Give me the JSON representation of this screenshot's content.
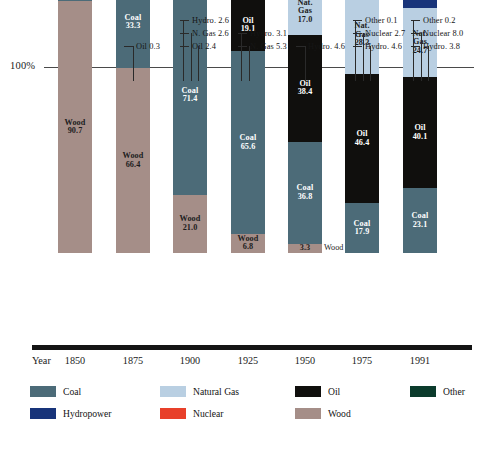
{
  "chart_data": {
    "type": "bar",
    "subtype": "stacked-100-percent",
    "title": "",
    "xlabel": "Year",
    "ylabel": "",
    "ylim": [
      0,
      100
    ],
    "axis_tick_labels": [
      "100%"
    ],
    "grid": false,
    "legend_position": "bottom",
    "categories": [
      "1850",
      "1875",
      "1900",
      "1925",
      "1950",
      "1975",
      "1991"
    ],
    "series": [
      {
        "name": "Wood",
        "color": "#a58e88",
        "values": [
          90.7,
          66.4,
          21.0,
          6.8,
          3.3,
          0.0,
          0.0
        ]
      },
      {
        "name": "Coal",
        "color": "#4c6b78",
        "values": [
          9.3,
          33.3,
          71.4,
          65.6,
          36.8,
          17.9,
          23.1
        ]
      },
      {
        "name": "Oil",
        "color": "#100f0d",
        "values": [
          0.0,
          0.3,
          2.4,
          19.1,
          38.4,
          46.4,
          40.1
        ]
      },
      {
        "name": "Natural Gas",
        "color": "#b9cfe2",
        "values": [
          0.0,
          0.0,
          2.6,
          5.3,
          17.0,
          28.3,
          24.7
        ]
      },
      {
        "name": "Hydropower",
        "color": "#18347a",
        "values": [
          0.0,
          0.0,
          2.6,
          3.1,
          4.6,
          4.6,
          3.8
        ]
      },
      {
        "name": "Nuclear",
        "color": "#e8402a",
        "values": [
          0.0,
          0.0,
          0.0,
          0.0,
          0.0,
          2.7,
          8.0
        ]
      },
      {
        "name": "Other",
        "color": "#0b3b2c",
        "values": [
          0.0,
          0.0,
          0.0,
          0.0,
          0.0,
          0.1,
          0.2
        ]
      }
    ],
    "bars": [
      {
        "year": "1850",
        "segments": [
          {
            "name": "Coal",
            "value": 9.3,
            "label": "Coal\n9.3",
            "label_inside": true,
            "text": "light"
          },
          {
            "name": "Wood",
            "value": 90.7,
            "label": "Wood\n90.7",
            "label_inside": true,
            "text": "dark"
          }
        ],
        "callouts": []
      },
      {
        "year": "1875",
        "segments": [
          {
            "name": "Oil",
            "value": 0.3,
            "label": "",
            "label_inside": false,
            "text": "light"
          },
          {
            "name": "Coal",
            "value": 33.3,
            "label": "Coal\n33.3",
            "label_inside": true,
            "text": "light"
          },
          {
            "name": "Wood",
            "value": 66.4,
            "label": "Wood\n66.4",
            "label_inside": true,
            "text": "dark"
          }
        ],
        "callouts": [
          {
            "text": "Oil 0.3",
            "row": 2
          }
        ]
      },
      {
        "year": "1900",
        "segments": [
          {
            "name": "Hydropower",
            "value": 2.6,
            "label": "",
            "label_inside": false,
            "text": "light"
          },
          {
            "name": "Natural Gas",
            "value": 2.6,
            "label": "",
            "label_inside": false,
            "text": "dark"
          },
          {
            "name": "Oil",
            "value": 2.4,
            "label": "",
            "label_inside": false,
            "text": "light"
          },
          {
            "name": "Coal",
            "value": 71.4,
            "label": "Coal\n71.4",
            "label_inside": true,
            "text": "light"
          },
          {
            "name": "Wood",
            "value": 21.0,
            "label": "Wood\n21.0",
            "label_inside": true,
            "text": "dark"
          }
        ],
        "callouts": [
          {
            "text": "Hydro. 2.6",
            "row": 0
          },
          {
            "text": "N. Gas 2.6",
            "row": 1
          },
          {
            "text": "Oil 2.4",
            "row": 2
          }
        ]
      },
      {
        "year": "1925",
        "segments": [
          {
            "name": "Hydropower",
            "value": 3.1,
            "label": "",
            "label_inside": false,
            "text": "light"
          },
          {
            "name": "Natural Gas",
            "value": 5.3,
            "label": "",
            "label_inside": false,
            "text": "dark"
          },
          {
            "name": "Oil",
            "value": 19.1,
            "label": "Oil\n19.1",
            "label_inside": true,
            "text": "light"
          },
          {
            "name": "Coal",
            "value": 65.6,
            "label": "Coal\n65.6",
            "label_inside": true,
            "text": "light"
          },
          {
            "name": "Wood",
            "value": 6.8,
            "label": "Wood\n6.8",
            "label_inside": true,
            "text": "dark"
          }
        ],
        "callouts": [
          {
            "text": "Hydro. 3.1",
            "row": 1
          },
          {
            "text": "N. Gas 5.3",
            "row": 2
          }
        ]
      },
      {
        "year": "1950",
        "segments": [
          {
            "name": "Hydropower",
            "value": 4.6,
            "label": "",
            "label_inside": false,
            "text": "light"
          },
          {
            "name": "Natural Gas",
            "value": 17.0,
            "label": "Nat.\nGas\n17.0",
            "label_inside": true,
            "text": "dark"
          },
          {
            "name": "Oil",
            "value": 38.4,
            "label": "Oil\n38.4",
            "label_inside": true,
            "text": "light"
          },
          {
            "name": "Coal",
            "value": 36.8,
            "label": "Coal\n36.8",
            "label_inside": true,
            "text": "light"
          },
          {
            "name": "Wood",
            "value": 3.3,
            "label": "3.3",
            "label_inside": true,
            "text": "dark",
            "outside_label": "Wood"
          }
        ],
        "callouts": [
          {
            "text": "Hydro. 4.6",
            "row": 2
          }
        ]
      },
      {
        "year": "1975",
        "segments": [
          {
            "name": "Other",
            "value": 0.1,
            "label": "",
            "label_inside": false,
            "text": "light"
          },
          {
            "name": "Nuclear",
            "value": 2.7,
            "label": "",
            "label_inside": false,
            "text": "light"
          },
          {
            "name": "Hydropower",
            "value": 4.6,
            "label": "",
            "label_inside": false,
            "text": "light"
          },
          {
            "name": "Natural Gas",
            "value": 28.3,
            "label": "Nat.\nGas\n28.3",
            "label_inside": true,
            "text": "dark"
          },
          {
            "name": "Oil",
            "value": 46.4,
            "label": "Oil\n46.4",
            "label_inside": true,
            "text": "light"
          },
          {
            "name": "Coal",
            "value": 17.9,
            "label": "Coal\n17.9",
            "label_inside": true,
            "text": "light"
          }
        ],
        "callouts": [
          {
            "text": "Other 0.1",
            "row": 0
          },
          {
            "text": "Nuclear 2.7",
            "row": 1
          },
          {
            "text": "Hydro. 4.6",
            "row": 2
          }
        ]
      },
      {
        "year": "1991",
        "segments": [
          {
            "name": "Other",
            "value": 0.2,
            "label": "",
            "label_inside": false,
            "text": "light"
          },
          {
            "name": "Nuclear",
            "value": 8.0,
            "label": "",
            "label_inside": false,
            "text": "light"
          },
          {
            "name": "Hydropower",
            "value": 3.8,
            "label": "",
            "label_inside": false,
            "text": "light"
          },
          {
            "name": "Natural Gas",
            "value": 24.7,
            "label": "Nat.\nGas\n24.7",
            "label_inside": true,
            "text": "dark"
          },
          {
            "name": "Oil",
            "value": 40.1,
            "label": "Oil\n40.1",
            "label_inside": true,
            "text": "light"
          },
          {
            "name": "Coal",
            "value": 23.1,
            "label": "Coal\n23.1",
            "label_inside": true,
            "text": "light"
          }
        ],
        "callouts": [
          {
            "text": "Other 0.2",
            "row": 0
          },
          {
            "text": "Nuclear 8.0",
            "row": 1
          },
          {
            "text": "Hydro. 3.8",
            "row": 2
          }
        ]
      }
    ],
    "legend": [
      {
        "label": "Coal",
        "color": "#4c6b78"
      },
      {
        "label": "Natural Gas",
        "color": "#b9cfe2"
      },
      {
        "label": "Oil",
        "color": "#100f0d"
      },
      {
        "label": "Other",
        "color": "#0b3b2c"
      },
      {
        "label": "Hydropower",
        "color": "#18347a"
      },
      {
        "label": "Nuclear",
        "color": "#e8402a"
      },
      {
        "label": "Wood",
        "color": "#a58e88"
      }
    ]
  },
  "axis": {
    "y_top_label": "100%",
    "x_axis_title": "Year"
  }
}
